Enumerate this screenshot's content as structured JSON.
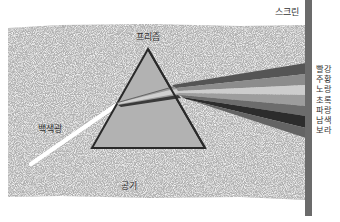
{
  "diagram": {
    "type": "prism-dispersion",
    "labels": {
      "prism": "프리즘",
      "screen": "스크린",
      "white_light": "백색광",
      "air": "공기"
    },
    "spectrum": [
      {
        "name": "빨강",
        "shade": "#5a5a5a"
      },
      {
        "name": "주황",
        "shade": "#8a8a8a"
      },
      {
        "name": "노랑",
        "shade": "#c9c9c9"
      },
      {
        "name": "초록",
        "shade": "#9a9a9a"
      },
      {
        "name": "파랑",
        "shade": "#6a6a6a"
      },
      {
        "name": "남색",
        "shade": "#2e2e2e"
      },
      {
        "name": "보라",
        "shade": "#626262"
      }
    ],
    "colors": {
      "background_region": "#b4b4b4",
      "prism_fill": "#b0b0b0",
      "prism_stroke": "#2a2a2a",
      "screen_bar": "#6b6b6b",
      "white_beam": "#ffffff"
    }
  }
}
